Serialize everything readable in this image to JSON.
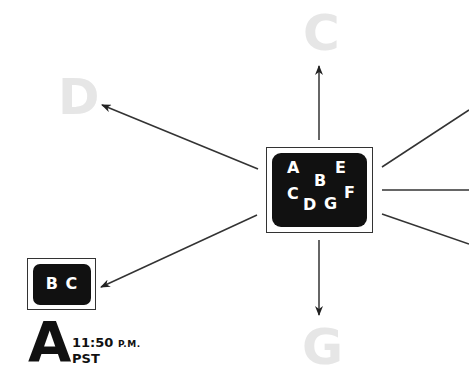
{
  "diagram": {
    "center_node": {
      "letters": [
        "A",
        "B",
        "C",
        "D",
        "E",
        "F",
        "G"
      ]
    },
    "targets": {
      "up": "C",
      "left_up": "D",
      "down": "G"
    },
    "bc_node": {
      "label": "B C"
    },
    "zone": {
      "letter": "A",
      "time": "11:50",
      "meridiem": "P.M.",
      "timezone": "PST"
    },
    "colors": {
      "ghost_letter": "#e6e6e6",
      "node_fill": "#111111",
      "line": "#333333"
    }
  }
}
